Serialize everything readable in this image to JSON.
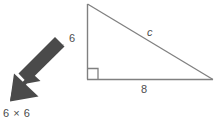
{
  "diagram": {
    "type": "right-triangle",
    "labels": {
      "leg_vertical": "6",
      "leg_horizontal": "8",
      "hypotenuse": "c"
    },
    "right_angle_marker": "right-angle-square",
    "colors": {
      "stroke": "#808080",
      "label_text": "#4d4d4d",
      "arrow_fill": "#4a4a4a",
      "background": "#ffffff"
    },
    "geometry": {
      "apex": [
        87,
        4
      ],
      "right_angle_vertex": [
        87,
        79
      ],
      "far_vertex": [
        213,
        79
      ]
    }
  },
  "annotation": {
    "arrow": {
      "icon": "arrow-down-left-icon",
      "direction": "down-left",
      "tail": [
        63,
        46
      ],
      "tip": [
        10,
        101
      ],
      "fill": "#4a4a4a"
    },
    "expression": "6 × 6"
  }
}
